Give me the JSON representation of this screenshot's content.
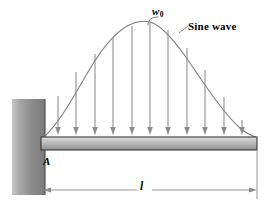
{
  "figure": {
    "background_color": "#ffffff",
    "width": 273,
    "height": 209
  },
  "labels": {
    "peak_load": "w",
    "peak_load_subscript": "0",
    "curve_name": "Sine wave",
    "support_point": "A",
    "length_dimension": "l"
  },
  "colors": {
    "wall_light": "#b9b9b9",
    "wall_dark": "#7d7d7d",
    "wall_outline": "#4a4a4a",
    "beam_top": "#d4d4d4",
    "beam_mid": "#b5b5b5",
    "beam_bottom": "#9a9a9a",
    "beam_outline": "#3a3a3a",
    "curve": "#7a7a7a",
    "arrow": "#8c8c8c",
    "dimension": "#8c8c8c",
    "text": "#000000"
  },
  "geometry": {
    "wall": {
      "x": 12,
      "y": 99,
      "width": 33,
      "height": 96
    },
    "beam": {
      "x": 41,
      "y": 137,
      "width": 216,
      "height": 13
    },
    "curve": {
      "left_x": 44,
      "right_x": 256,
      "baseline_y": 137,
      "peak_x": 150,
      "peak_y": 22,
      "amplitude": 115
    },
    "dimension_line": {
      "y": 190,
      "x_start": 44,
      "x_end": 257
    },
    "extension_line": {
      "x": 257,
      "y_top": 150,
      "y_bottom": 198
    }
  },
  "load_arrows": {
    "count": 11,
    "x_positions": [
      58,
      76,
      95,
      113,
      132,
      150,
      168,
      187,
      205,
      224,
      242
    ],
    "tip_y": 134,
    "description": "vertical downward load arrows from sine curve to beam"
  },
  "leader": {
    "description": "hook leader from w0 label down to curve peak",
    "from_x": 157,
    "from_y": 18,
    "to_x": 150,
    "to_y": 24
  }
}
